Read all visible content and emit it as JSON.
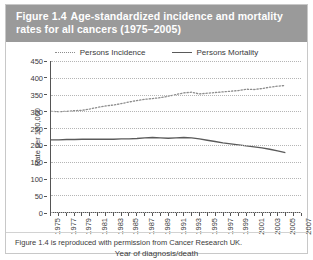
{
  "figure": {
    "number": "Figure 1.4",
    "title": "Age-standardized incidence and mortality rates for all cancers (1975–2005)",
    "source_note": "Figure 1.4 is reproduced with permission from Cancer Research UK.",
    "header_color": "#9a9a9a"
  },
  "legend": {
    "incidence_label": "Persons Incidence",
    "mortality_label": "Persons Mortality",
    "incidence_color": "#8d8d8d",
    "mortality_color": "#5a5a5a"
  },
  "chart_data": {
    "type": "line",
    "title": "Age-standardized incidence and mortality rates for all cancers (1975–2005)",
    "xlabel": "Year of diagnosis/death",
    "ylabel": "Rate per 100,000",
    "xlim": [
      1975,
      2007
    ],
    "ylim": [
      0,
      450
    ],
    "yticks": [
      0,
      50,
      100,
      150,
      200,
      250,
      300,
      350,
      400,
      450
    ],
    "xticks": [
      1975,
      1977,
      1979,
      1981,
      1983,
      1985,
      1987,
      1989,
      1991,
      1993,
      1995,
      1997,
      1999,
      2001,
      2003,
      2005,
      2007
    ],
    "grid": true,
    "legend_position": "top-center",
    "x": [
      1975,
      1976,
      1977,
      1978,
      1979,
      1980,
      1981,
      1982,
      1983,
      1984,
      1985,
      1986,
      1987,
      1988,
      1989,
      1990,
      1991,
      1992,
      1993,
      1994,
      1995,
      1996,
      1997,
      1998,
      1999,
      2000,
      2001,
      2002,
      2003,
      2004,
      2005
    ],
    "series": [
      {
        "name": "Persons Incidence",
        "style": "dotted",
        "values": [
          300,
          299,
          300,
          302,
          303,
          307,
          312,
          316,
          319,
          323,
          328,
          332,
          336,
          338,
          341,
          345,
          350,
          355,
          357,
          352,
          354,
          356,
          358,
          360,
          362,
          366,
          365,
          368,
          372,
          375,
          377
        ]
      },
      {
        "name": "Persons Mortality",
        "style": "solid",
        "values": [
          215,
          215,
          216,
          216,
          217,
          217,
          217,
          217,
          217,
          218,
          218,
          219,
          221,
          222,
          221,
          220,
          221,
          222,
          221,
          218,
          214,
          210,
          206,
          203,
          200,
          197,
          194,
          191,
          187,
          182,
          177
        ]
      }
    ]
  }
}
